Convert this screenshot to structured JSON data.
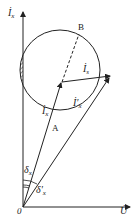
{
  "diagram": {
    "type": "phasor-diagram",
    "labels": {
      "y_axis": "İ",
      "y_axis_sub": "x",
      "x_axis": "U̇",
      "origin": "0",
      "point_b": "B",
      "point_a": "A",
      "vec_is": "İ",
      "vec_is_sub": "s",
      "vec_ix": "İ",
      "vec_ix_sub": "x",
      "vec_ixp": "İ′",
      "vec_ixp_sub": "x",
      "angle_dx": "δ",
      "angle_dx_sub": "x",
      "angle_dxp": "δ′",
      "angle_dxp_sub": "x"
    },
    "colors": {
      "line": "#222222",
      "background": "#ffffff"
    }
  }
}
